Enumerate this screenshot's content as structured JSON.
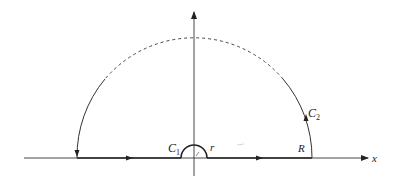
{
  "diagram": {
    "title": "",
    "axes": {
      "x_label": "x",
      "y_label": ""
    },
    "labels": {
      "c1": "C",
      "c1_sub": "1",
      "c2": "C",
      "c2_sub": "2",
      "small_radius": "r",
      "large_radius": "R"
    },
    "contour": {
      "large_arc": "semicircle of radius R, counterclockwise, partially dashed at top",
      "small_arc": "semicircle of radius r around origin (indentation)",
      "segments": [
        "[-R, -r] on real axis",
        "[r, R] on real axis"
      ]
    },
    "colors": {
      "stroke": "#222222",
      "background": "#ffffff"
    }
  }
}
